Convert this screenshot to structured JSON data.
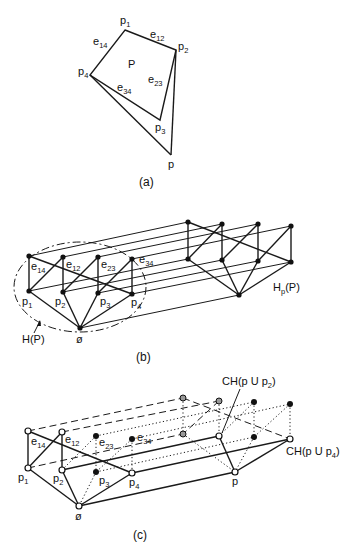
{
  "panel_a": {
    "caption": "(a)",
    "polygon_label": "P",
    "vertices": [
      {
        "name": "p1",
        "base": "p",
        "sub": "1",
        "x": 125,
        "y": 30
      },
      {
        "name": "p2",
        "base": "p",
        "sub": "2",
        "x": 176,
        "y": 50
      },
      {
        "name": "p3",
        "base": "p",
        "sub": "3",
        "x": 160,
        "y": 120
      },
      {
        "name": "p4",
        "base": "p",
        "sub": "4",
        "x": 90,
        "y": 75
      },
      {
        "name": "p",
        "base": "p",
        "sub": "",
        "x": 171,
        "y": 155
      }
    ],
    "edges": [
      {
        "base": "e",
        "sub": "12"
      },
      {
        "base": "e",
        "sub": "23"
      },
      {
        "base": "e",
        "sub": "34"
      },
      {
        "base": "e",
        "sub": "14"
      }
    ]
  },
  "panel_b": {
    "caption": "(b)",
    "left_label": "H(P)",
    "right_label_base": "H",
    "right_label_sub": "p",
    "right_label_tail": "(P)",
    "bottom_label": "ø",
    "top_nodes": [
      {
        "base": "e",
        "sub": "14"
      },
      {
        "base": "e",
        "sub": "12"
      },
      {
        "base": "e",
        "sub": "23"
      },
      {
        "base": "e",
        "sub": "34"
      }
    ],
    "bottom_nodes": [
      {
        "base": "p",
        "sub": "1"
      },
      {
        "base": "p",
        "sub": "2"
      },
      {
        "base": "p",
        "sub": "3"
      },
      {
        "base": "p",
        "sub": "4"
      }
    ]
  },
  "panel_c": {
    "caption": "(c)",
    "bottom_label": "ø",
    "apex_label": "p",
    "annotation_1": {
      "base": "CH(p U p",
      "sub": "2",
      "tail": ")"
    },
    "annotation_2": {
      "base": "CH(p U p",
      "sub": "4",
      "tail": ")"
    },
    "top_nodes": [
      {
        "base": "e",
        "sub": "14"
      },
      {
        "base": "e",
        "sub": "12"
      },
      {
        "base": "e",
        "sub": "23"
      },
      {
        "base": "e",
        "sub": "34"
      }
    ],
    "bottom_nodes": [
      {
        "base": "p",
        "sub": "1"
      },
      {
        "base": "p",
        "sub": "2"
      },
      {
        "base": "p",
        "sub": "3"
      },
      {
        "base": "p",
        "sub": "4"
      }
    ]
  }
}
